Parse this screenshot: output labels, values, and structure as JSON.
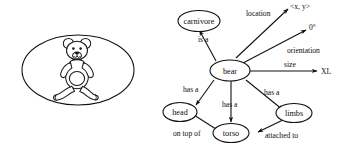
{
  "figure": {
    "title": "",
    "panels": [
      {
        "name": "teddy-bear-image",
        "caption": "",
        "content": "teddy bear line drawing inside ellipse"
      },
      {
        "name": "semantic-network",
        "caption": ""
      }
    ]
  },
  "graph": {
    "nodes": [
      {
        "id": "carnivore",
        "label": "carnivore"
      },
      {
        "id": "bear",
        "label": "bear"
      },
      {
        "id": "head",
        "label": "head"
      },
      {
        "id": "torso",
        "label": "torso"
      },
      {
        "id": "limbs",
        "label": "limbs"
      }
    ],
    "values": [
      {
        "id": "location-value",
        "label": "<x, y>"
      },
      {
        "id": "orientation-value",
        "label": "0°"
      },
      {
        "id": "size-value",
        "label": "XL"
      }
    ],
    "edges": [
      {
        "id": "bear-isa-carnivore",
        "label": "is a",
        "from": "bear",
        "to": "carnivore"
      },
      {
        "id": "bear-location",
        "label": "location",
        "from": "bear",
        "to": "location-value"
      },
      {
        "id": "bear-orientation",
        "label": "orientation",
        "from": "bear",
        "to": "orientation-value"
      },
      {
        "id": "bear-size",
        "label": "size",
        "from": "bear",
        "to": "size-value"
      },
      {
        "id": "bear-hasa-head",
        "label": "has a",
        "from": "bear",
        "to": "head"
      },
      {
        "id": "bear-hasa-torso",
        "label": "has a",
        "from": "bear",
        "to": "torso"
      },
      {
        "id": "bear-hasa-limbs",
        "label": "has a",
        "from": "bear",
        "to": "limbs"
      },
      {
        "id": "head-ontopof-torso",
        "label": "on top of",
        "from": "head",
        "to": "torso"
      },
      {
        "id": "limbs-attachedto-torso",
        "label": "attached to",
        "from": "limbs",
        "to": "torso"
      }
    ]
  },
  "colors": {
    "ink": "#111111",
    "paper": "#ffffff"
  }
}
